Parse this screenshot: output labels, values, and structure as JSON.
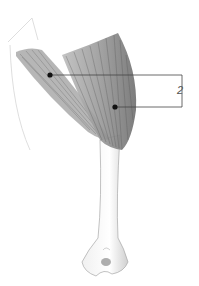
{
  "figure": {
    "type": "anatomical-illustration",
    "callouts": [
      {
        "id": 1,
        "x": 50,
        "y": 75
      },
      {
        "id": 2,
        "x": 115,
        "y": 107
      }
    ],
    "bracket_label": "2",
    "colors": {
      "ink": "#333333",
      "muscle": "#8a8a8a",
      "bone": "#d8d8d8"
    }
  }
}
